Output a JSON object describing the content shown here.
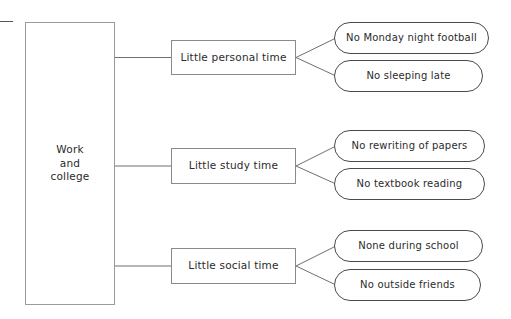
{
  "diagram": {
    "type": "tree",
    "colors": {
      "background": "#ffffff",
      "stroke": "#8d8d8d",
      "detail_stroke": "#4a4a4a",
      "text": "#2b2b2b"
    },
    "root": {
      "id": "root",
      "lines": [
        "Work",
        "and",
        "college"
      ],
      "text": "Work and college"
    },
    "branches": [
      {
        "id": "branch-personal",
        "label": "Little personal time",
        "details": [
          {
            "id": "detail-monday-football",
            "label": "No Monday night football"
          },
          {
            "id": "detail-sleeping-late",
            "label": "No sleeping late"
          }
        ]
      },
      {
        "id": "branch-study",
        "label": "Little study time",
        "details": [
          {
            "id": "detail-rewriting-papers",
            "label": "No rewriting of papers"
          },
          {
            "id": "detail-textbook-reading",
            "label": "No textbook reading"
          }
        ]
      },
      {
        "id": "branch-social",
        "label": "Little social time",
        "details": [
          {
            "id": "detail-none-during-school",
            "label": "None during school"
          },
          {
            "id": "detail-outside-friends",
            "label": "No outside friends"
          }
        ]
      }
    ]
  }
}
